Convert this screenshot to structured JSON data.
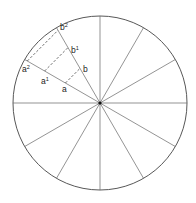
{
  "diagram": {
    "type": "circle-divided-into-12-sectors",
    "center": [
      100,
      103
    ],
    "radius": 87,
    "sectors": 12,
    "colors": {
      "stroke": "#555555",
      "circle_stroke": "#444444",
      "center_dot": "#111111",
      "dashed": "#333333"
    },
    "labels": {
      "a": "a",
      "a1_base": "a",
      "a1_sup": "1",
      "a2_base": "a",
      "a2_sup": "2",
      "b": "b",
      "b1_base": "b",
      "b1_sup": "1",
      "b2_base": "b",
      "b2_sup": "2"
    },
    "construction": {
      "line_a_angle_deg": 150,
      "line_b_angle_deg": 120,
      "distances_from_center": [
        40,
        64,
        84
      ],
      "dashed_pairs": [
        [
          "a",
          "b"
        ],
        [
          "a1",
          "b1"
        ],
        [
          "a2",
          "b2"
        ]
      ]
    }
  }
}
